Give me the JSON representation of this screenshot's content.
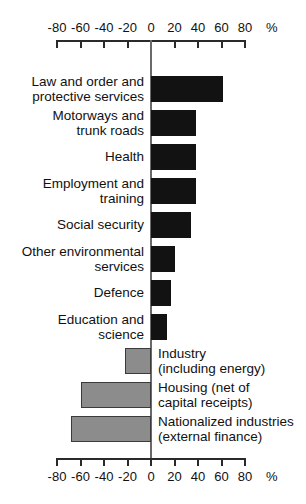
{
  "chart_data": {
    "type": "bar",
    "orientation": "horizontal",
    "title": "",
    "xlabel": "%",
    "ylabel": "",
    "xlim": [
      -80,
      80
    ],
    "grid": false,
    "legend": null,
    "axis_unit": "%",
    "tick_labels": [
      "-80",
      "-60",
      "-40",
      "-20",
      "0",
      "20",
      "40",
      "60",
      "80"
    ],
    "tick_values": [
      -80,
      -60,
      -40,
      -20,
      0,
      20,
      40,
      60,
      80
    ],
    "colors": {
      "positive": "#121212",
      "negative": "#8c8c8c",
      "axis": "#2a2a2a",
      "zero_line": "#6a6a6a"
    },
    "categories": [
      "Law and order and\nprotective services",
      "Motorways and\ntrunk roads",
      "Health",
      "Employment and\ntraining",
      "Social security",
      "Other environmental\nservices",
      "Defence",
      "Education and\nscience",
      "Industry\n(including energy)",
      "Housing (net of\ncapital receipts)",
      "Nationalized industries\n(external finance)"
    ],
    "values": [
      61,
      38,
      38,
      38,
      34,
      20,
      17,
      14,
      -22,
      -60,
      -68
    ],
    "bars": [
      {
        "label": "Law and order and\nprotective services",
        "value": 61,
        "label_side": "left",
        "color": "positive"
      },
      {
        "label": "Motorways and\ntrunk roads",
        "value": 38,
        "label_side": "left",
        "color": "positive"
      },
      {
        "label": "Health",
        "value": 38,
        "label_side": "left",
        "color": "positive"
      },
      {
        "label": "Employment and\ntraining",
        "value": 38,
        "label_side": "left",
        "color": "positive"
      },
      {
        "label": "Social security",
        "value": 34,
        "label_side": "left",
        "color": "positive"
      },
      {
        "label": "Other environmental\nservices",
        "value": 20,
        "label_side": "left",
        "color": "positive"
      },
      {
        "label": "Defence",
        "value": 17,
        "label_side": "left",
        "color": "positive"
      },
      {
        "label": "Education and\nscience",
        "value": 14,
        "label_side": "left",
        "color": "positive"
      },
      {
        "label": "Industry\n(including energy)",
        "value": -22,
        "label_side": "right",
        "color": "negative"
      },
      {
        "label": "Housing (net of\ncapital receipts)",
        "value": -60,
        "label_side": "right",
        "color": "negative"
      },
      {
        "label": "Nationalized industries\n(external finance)",
        "value": -68,
        "label_side": "right",
        "color": "negative"
      }
    ]
  }
}
